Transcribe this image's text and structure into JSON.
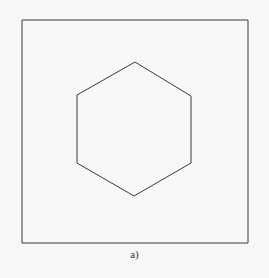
{
  "figure": {
    "caption": "a)",
    "stroke_color": "#3a3a3a",
    "frame": {
      "x1": 22,
      "y1": 20,
      "x2": 248,
      "y2": 243
    },
    "hexagon": {
      "points": [
        [
          135,
          62
        ],
        [
          191,
          96
        ],
        [
          191,
          163
        ],
        [
          134,
          196
        ],
        [
          77,
          163
        ],
        [
          77,
          95
        ]
      ]
    }
  }
}
